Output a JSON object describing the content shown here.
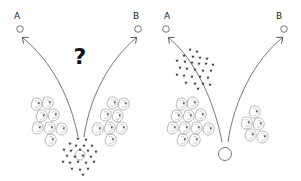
{
  "panels": [
    {
      "id": "left",
      "target_a": {
        "label": "A"
      },
      "target_b": {
        "label": "B"
      },
      "question": "?",
      "description": "Cluster of small dark triangles centered between two groups of molecule shapes; arrows diverge to A and B"
    },
    {
      "id": "right",
      "target_a": {
        "label": "A"
      },
      "target_b": {
        "label": "B"
      },
      "description": "Cluster of small dark triangles moved toward A along the left arrow; empty circle at origin; molecule groups on both sides"
    }
  ],
  "colors": {
    "line": "#555555",
    "triangle": "#444444",
    "molecule_outline": "#777777",
    "background": "#ffffff"
  }
}
